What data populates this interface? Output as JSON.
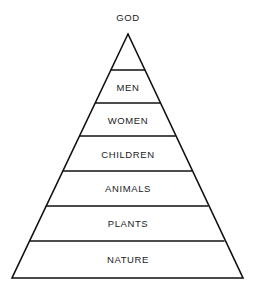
{
  "diagram": {
    "type": "pyramid",
    "background_color": "#ffffff",
    "stroke_color": "#111111",
    "text_color": "#1a1a1a",
    "apex": {
      "label": "GOD",
      "name": "apex-label-god",
      "position": "above-apex"
    },
    "tiers": [
      {
        "index": 0,
        "label": "",
        "name": "tier-apex-blank",
        "top_y": 34,
        "bottom_y": 70,
        "label_y": 0,
        "left_x_top": 128,
        "right_x_top": 128,
        "left_x_bottom": 110.9,
        "right_x_bottom": 145.1
      },
      {
        "index": 1,
        "label": "MEN",
        "name": "tier-men",
        "top_y": 70,
        "bottom_y": 103,
        "label_y": 88,
        "left_x_top": 110.9,
        "right_x_top": 145.1,
        "left_x_bottom": 95.2,
        "right_x_bottom": 160.4
      },
      {
        "index": 2,
        "label": "WOMEN",
        "name": "tier-women",
        "top_y": 103,
        "bottom_y": 136,
        "label_y": 121,
        "left_x_top": 95.2,
        "right_x_top": 160.4,
        "left_x_bottom": 79.5,
        "right_x_bottom": 175.6
      },
      {
        "index": 3,
        "label": "CHILDREN",
        "name": "tier-children",
        "top_y": 136,
        "bottom_y": 171,
        "label_y": 155,
        "left_x_top": 79.5,
        "right_x_top": 175.6,
        "left_x_bottom": 62.8,
        "right_x_bottom": 192.0
      },
      {
        "index": 4,
        "label": "ANIMALS",
        "name": "tier-animals",
        "top_y": 171,
        "bottom_y": 206,
        "label_y": 189,
        "left_x_top": 62.8,
        "right_x_top": 192.0,
        "left_x_bottom": 46.2,
        "right_x_bottom": 208.2
      },
      {
        "index": 5,
        "label": "PLANTS",
        "name": "tier-plants",
        "top_y": 206,
        "bottom_y": 241,
        "label_y": 224,
        "left_x_top": 46.2,
        "right_x_top": 208.2,
        "left_x_bottom": 29.6,
        "right_x_bottom": 224.5
      },
      {
        "index": 6,
        "label": "NATURE",
        "name": "tier-nature",
        "top_y": 241,
        "bottom_y": 278,
        "label_y": 260,
        "left_x_top": 29.6,
        "right_x_top": 224.5,
        "left_x_bottom": 12.0,
        "right_x_bottom": 243.0
      }
    ],
    "geometry": {
      "apex_x": 128,
      "apex_y": 34,
      "base_left_x": 12,
      "base_right_x": 243,
      "base_y": 278
    }
  }
}
